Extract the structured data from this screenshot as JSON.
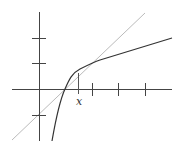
{
  "diagram": {
    "labels": {
      "x_marker": "x"
    },
    "colors": {
      "axes": "#444444",
      "curve": "#333333",
      "line": "#bbbbbb"
    },
    "axes": {
      "x_ticks_px": [
        78,
        92,
        118,
        145
      ],
      "y_ticks_px": [
        38,
        63,
        115
      ]
    }
  }
}
